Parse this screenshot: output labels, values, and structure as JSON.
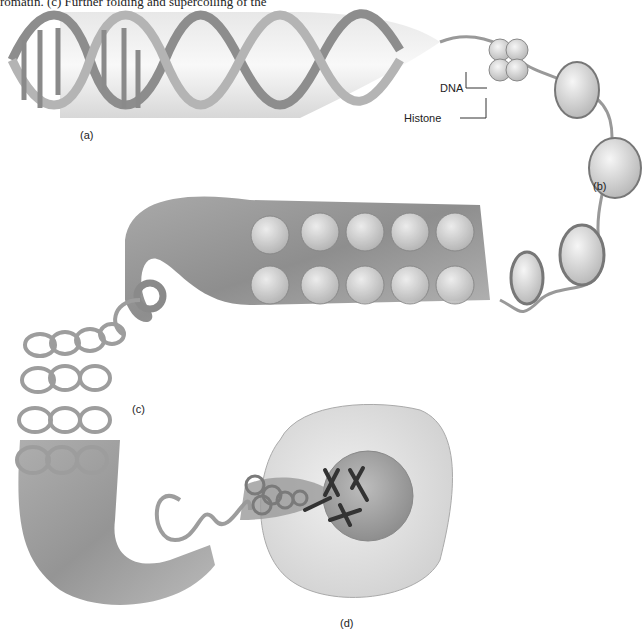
{
  "caption": "romatin. (c) Further folding and supercoiling of the",
  "labels": {
    "a": "(a)",
    "b": "(b)",
    "c": "(c)",
    "d": "(d)",
    "dna": "DNA",
    "histone": "Histone"
  },
  "parts": [
    {
      "id": "a",
      "name": "DNA double helix"
    },
    {
      "id": "b",
      "name": "Nucleosomes (beads on a string)"
    },
    {
      "id": "c",
      "name": "Supercoiled chromatin fiber"
    },
    {
      "id": "d",
      "name": "Cell nucleus with chromosomes"
    }
  ]
}
